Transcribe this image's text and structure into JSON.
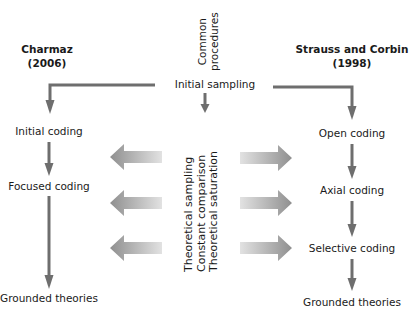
{
  "diagram": {
    "left_column": {
      "title": "Charmaz",
      "year": "(2006)",
      "steps": [
        "Initial coding",
        "Focused coding",
        "Grounded theories"
      ]
    },
    "right_column": {
      "title": "Strauss and Corbin",
      "year": "(1998)",
      "steps": [
        "Open coding",
        "Axial coding",
        "Selective coding",
        "Grounded theories"
      ]
    },
    "center": {
      "header_line1": "Common",
      "header_line2": "procedures",
      "start": "Initial sampling",
      "procedures": [
        "Theoretical sampling",
        "Constant comparison",
        "Theoretical saturation"
      ]
    },
    "colors": {
      "line": "#6e6e6e",
      "fat_arrow_light": "#d9d9d9",
      "fat_arrow_dark": "#9a9a9a",
      "text": "#1a1a1a"
    }
  }
}
